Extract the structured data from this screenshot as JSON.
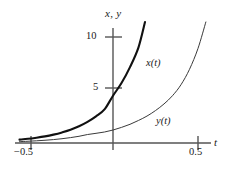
{
  "figure": {
    "background": "#ffffff",
    "axis_color": "#555555",
    "curve_x_color": "#1a1a1a",
    "curve_y_color": "#3a3a3a"
  },
  "labels": {
    "y_axis_title": "x, y",
    "x_axis_title": "t",
    "curve_x": "x(t)",
    "curve_y": "y(t)",
    "ytick_10": "10",
    "ytick_5": "5",
    "xtick_neg": "−0.5",
    "xtick_pos": "0.5"
  },
  "chart_data": {
    "type": "line",
    "title": "",
    "xlabel": "t",
    "ylabel": "x, y",
    "xlim": [
      -0.6,
      0.58
    ],
    "ylim": [
      0,
      11.8
    ],
    "xticks": [
      -0.5,
      0.5
    ],
    "xticklabels": [
      "−0.5",
      "0.5"
    ],
    "yticks": [
      5,
      10
    ],
    "yticklabels": [
      "5",
      "10"
    ],
    "grid": false,
    "legend": "inline-annotations",
    "annotations": [
      {
        "text": "x(t)",
        "x": 0.19,
        "y": 7.0
      },
      {
        "text": "y(t)",
        "x": 0.26,
        "y": 2.3
      }
    ],
    "series": [
      {
        "name": "x(t)",
        "linewidth": "thick",
        "x": [
          -0.55,
          -0.5,
          -0.45,
          -0.4,
          -0.35,
          -0.3,
          -0.25,
          -0.2,
          -0.15,
          -0.1,
          -0.05,
          0.0,
          0.05,
          0.1,
          0.15,
          0.2
        ],
        "values": [
          0.31,
          0.38,
          0.48,
          0.6,
          0.76,
          0.96,
          1.2,
          1.52,
          1.92,
          2.42,
          3.05,
          4.3,
          5.45,
          6.9,
          8.7,
          11.7
        ]
      },
      {
        "name": "y(t)",
        "linewidth": "thin",
        "x": [
          -0.55,
          -0.5,
          -0.45,
          -0.4,
          -0.35,
          -0.3,
          -0.25,
          -0.2,
          -0.15,
          -0.1,
          -0.05,
          0.0,
          0.05,
          0.1,
          0.15,
          0.2,
          0.25,
          0.3,
          0.35,
          0.4,
          0.45,
          0.5,
          0.55
        ],
        "values": [
          0.12,
          0.16,
          0.2,
          0.25,
          0.31,
          0.39,
          0.49,
          0.61,
          0.77,
          0.88,
          1.0,
          1.18,
          1.42,
          1.7,
          2.05,
          2.45,
          2.95,
          3.55,
          4.3,
          5.3,
          6.7,
          8.6,
          11.2
        ]
      }
    ]
  }
}
